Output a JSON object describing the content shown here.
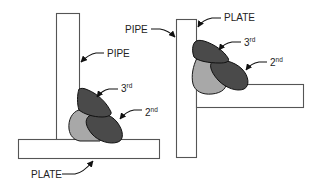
{
  "figure": {
    "colors": {
      "first_bead": "#a8a8a8",
      "dark_beads": "#4a4a4a",
      "outline": "#555555",
      "background": "#ffffff"
    }
  },
  "left_diagram": {
    "labels": {
      "pipe": "PIPE",
      "plate": "PLATE",
      "third": {
        "base": "3",
        "suffix": "rd"
      },
      "second": {
        "base": "2",
        "suffix": "nd"
      }
    }
  },
  "right_diagram": {
    "labels": {
      "pipe": "PIPE",
      "plate": "PLATE",
      "third": {
        "base": "3",
        "suffix": "rd"
      },
      "second": {
        "base": "2",
        "suffix": "nd"
      }
    }
  }
}
